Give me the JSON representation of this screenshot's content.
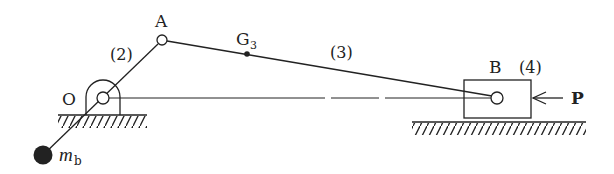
{
  "diagram": {
    "type": "slider-crank mechanism",
    "colors": {
      "ink": "#222222",
      "background": "#ffffff"
    },
    "labels": {
      "pivot_o": "O",
      "joint_a": "A",
      "joint_b": "B",
      "center_of_gravity": "G",
      "center_of_gravity_sub": "3",
      "link_2": "(2)",
      "link_3": "(3)",
      "link_4": "(4)",
      "force": "P",
      "balance_mass": "m",
      "balance_mass_sub": "b"
    },
    "points": {
      "O": [
        103,
        98
      ],
      "A": [
        162,
        40
      ],
      "G3": [
        247,
        54
      ],
      "B": [
        497,
        98
      ],
      "mb": [
        43,
        155
      ]
    }
  }
}
